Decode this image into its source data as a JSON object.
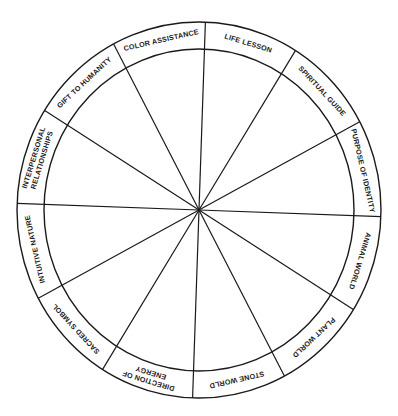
{
  "diagram": {
    "type": "medicine-wheel",
    "segments": 12,
    "colors": {
      "stroke": "#1a1a1a",
      "background": "#ffffff",
      "text": "#1a1a1a"
    },
    "labels": [
      {
        "id": "life-lesson",
        "lines": [
          "LIFE LESSON"
        ]
      },
      {
        "id": "spiritual-guide",
        "lines": [
          "SPIRITUAL GUIDE"
        ]
      },
      {
        "id": "purpose-of-identity",
        "lines": [
          "PURPOSE OF IDENTITY"
        ]
      },
      {
        "id": "animal-world",
        "lines": [
          "ANIMAL WORLD"
        ]
      },
      {
        "id": "plant-world",
        "lines": [
          "PLANT WORLD"
        ]
      },
      {
        "id": "stone-world",
        "lines": [
          "STONE WORLD"
        ]
      },
      {
        "id": "direction-of-energy",
        "lines": [
          "DIRECTION OF",
          "ENERGY"
        ]
      },
      {
        "id": "sacred-symbol",
        "lines": [
          "SACRED SYMBOL"
        ]
      },
      {
        "id": "intuitive-nature",
        "lines": [
          "INTUITIVE NATURE"
        ]
      },
      {
        "id": "interpersonal-relationships",
        "lines": [
          "INTERPERSONAL",
          "RELATIONSHIPS"
        ]
      },
      {
        "id": "gift-to-humanity",
        "lines": [
          "GIFT TO HUMANITY"
        ]
      },
      {
        "id": "color-assistance",
        "lines": [
          "COLOR ASSISTANCE"
        ]
      }
    ]
  }
}
